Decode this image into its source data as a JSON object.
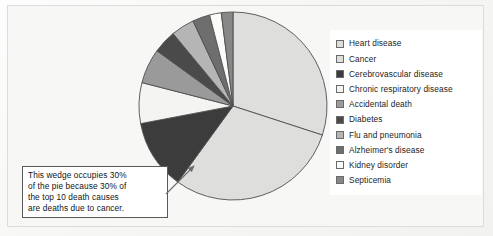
{
  "figure": {
    "background_color": "#f7f7f5",
    "frame_color": "#dcdcdc"
  },
  "chart_data": {
    "type": "pie",
    "title": "",
    "start_angle_deg": 0,
    "direction": "clockwise",
    "legend_position": "right",
    "grid": false,
    "center": [
      232,
      105
    ],
    "radius_px": 95,
    "categories": [
      "Heart disease",
      "Cancer",
      "Cerebrovascular disease",
      "Chronic respiratory disease",
      "Accidental death",
      "Diabetes",
      "Flu and pneumonia",
      "Alzheimer's disease",
      "Kidney disorder",
      "Septicemia"
    ],
    "values": [
      30,
      30,
      12,
      7,
      6,
      4,
      4,
      3,
      2,
      2
    ],
    "unit": "percent",
    "colors": [
      "#dededc",
      "#dededc",
      "#3c3c3c",
      "#f4f4f2",
      "#9a9a9a",
      "#4a4a4a",
      "#b5b5b5",
      "#6e6e6e",
      "#fbfbf9",
      "#878787"
    ],
    "wedge_edge_color": "#4f4f4f",
    "annotations": [
      {
        "target": "Cancer",
        "text": "This wedge occupies 30% of the pie because 30% of the top 10 death causes are deaths due to cancer."
      }
    ]
  },
  "legend": {
    "items": [
      {
        "label": "Heart disease",
        "color": "#dededc"
      },
      {
        "label": "Cancer",
        "color": "#dededc"
      },
      {
        "label": "Cerebrovascular disease",
        "color": "#3c3c3c"
      },
      {
        "label": "Chronic respiratory disease",
        "color": "#f4f4f2"
      },
      {
        "label": "Accidental death",
        "color": "#9a9a9a"
      },
      {
        "label": "Diabetes",
        "color": "#4a4a4a"
      },
      {
        "label": "Flu and pneumonia",
        "color": "#b5b5b5"
      },
      {
        "label": "Alzheimer's disease",
        "color": "#6e6e6e"
      },
      {
        "label": "Kidney disorder",
        "color": "#fbfbf9"
      },
      {
        "label": "Septicemia",
        "color": "#878787"
      }
    ]
  },
  "callout": {
    "lines": [
      "This wedge occupies 30%",
      "of the pie because 30% of",
      "the top 10 death causes",
      "are deaths due to cancer."
    ]
  }
}
